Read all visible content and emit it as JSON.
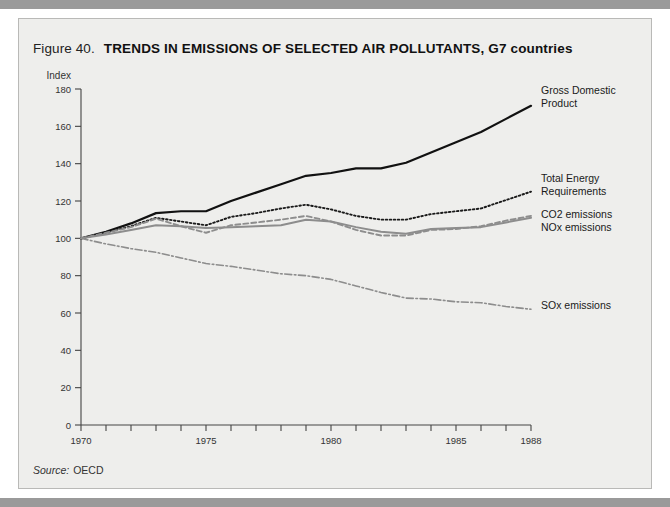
{
  "figure": {
    "number_label": "Figure 40.",
    "title": "TRENDS IN EMISSIONS OF SELECTED AIR POLLUTANTS, G7 countries",
    "source_label": "Source:",
    "source_value": "OECD"
  },
  "colors": {
    "panel_background": "#eeeeec",
    "panel_border": "#b9b9b7",
    "page_band": "#9a9a9a",
    "axis": "#444444",
    "gdp": "#111111",
    "energy": "#1a1a1a",
    "co2": "#8d8d8d",
    "nox": "#8d8d8d",
    "sox": "#8d8d8d"
  },
  "chart_data": {
    "type": "line",
    "title": "TRENDS IN EMISSIONS OF SELECTED AIR POLLUTANTS, G7 countries",
    "xlabel": "",
    "ylabel": "Index",
    "xlim": [
      1970,
      1988
    ],
    "ylim": [
      0,
      180
    ],
    "yticks": [
      0,
      20,
      40,
      60,
      80,
      100,
      120,
      140,
      160,
      180
    ],
    "xticks": [
      1970,
      1971,
      1972,
      1973,
      1974,
      1975,
      1976,
      1977,
      1978,
      1979,
      1980,
      1981,
      1982,
      1983,
      1984,
      1985,
      1986,
      1987,
      1988
    ],
    "xtick_labels_shown": [
      1970,
      1975,
      1980,
      1985,
      1988
    ],
    "grid": false,
    "legend_position": "right-inline-labels",
    "x": [
      1970,
      1971,
      1972,
      1973,
      1974,
      1975,
      1976,
      1977,
      1978,
      1979,
      1980,
      1981,
      1982,
      1983,
      1984,
      1985,
      1986,
      1987,
      1988
    ],
    "series": [
      {
        "name": "Gross Domestic Product",
        "label": "Gross Domestic\nProduct",
        "label_line1": "Gross Domestic",
        "label_line2": "Product",
        "style": "solid",
        "color": "#111111",
        "values": [
          100,
          103.5,
          108,
          113.5,
          114.5,
          114.5,
          120,
          124.5,
          129,
          133.5,
          135,
          137.5,
          137.5,
          140.5,
          146,
          151.5,
          157,
          164,
          171
        ]
      },
      {
        "name": "Total Energy Requirements",
        "label": "Total Energy\nRequirements",
        "label_line1": "Total Energy",
        "label_line2": "Requirements",
        "style": "dotted",
        "color": "#1a1a1a",
        "values": [
          100,
          103,
          106.5,
          111,
          109,
          107,
          111.5,
          113.5,
          116,
          118,
          115.5,
          112,
          110,
          110,
          113,
          114.5,
          116,
          120.5,
          125
        ]
      },
      {
        "name": "CO2 emissions",
        "label": "CO2 emissions",
        "label_line1": "CO2 emissions",
        "label_line2": "",
        "style": "dashed",
        "color": "#8d8d8d",
        "values": [
          100,
          103,
          106,
          110.5,
          106.5,
          103,
          107,
          108.5,
          110,
          112,
          109,
          104.5,
          101.5,
          101.5,
          104.5,
          105,
          106.5,
          109.5,
          112
        ]
      },
      {
        "name": "NOx emissions",
        "label": "NOx emissions",
        "label_line1": "NOx emissions",
        "label_line2": "",
        "style": "solid-grey",
        "color": "#8d8d8d",
        "values": [
          100,
          102,
          104.5,
          107,
          106.5,
          105.5,
          106,
          106.5,
          107,
          110,
          109,
          106,
          103.5,
          102.5,
          105,
          105.5,
          106,
          108.5,
          111
        ]
      },
      {
        "name": "SOx emissions",
        "label": "SOx emissions",
        "label_line1": "SOx emissions",
        "label_line2": "",
        "style": "dash-dot",
        "color": "#8d8d8d",
        "values": [
          100,
          97,
          94.5,
          92.5,
          89.5,
          86.5,
          85,
          83,
          81,
          80,
          78,
          74.5,
          71,
          68,
          67.5,
          66,
          65.5,
          63.5,
          62
        ]
      }
    ]
  }
}
